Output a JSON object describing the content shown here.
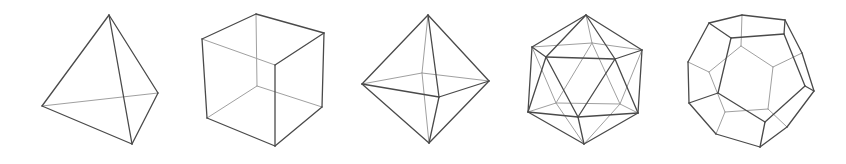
{
  "figure": {
    "colors": {
      "front_edge": "#4a4a4a",
      "back_edge": "#a0a0a0",
      "background": "#ffffff"
    },
    "solids": [
      {
        "name": "tetrahedron",
        "vertices": {
          "top": [
            109,
            15
          ],
          "left": [
            42,
            106
          ],
          "right": [
            158,
            93
          ],
          "bottom": [
            132,
            144
          ]
        },
        "front_edges": [
          [
            "top",
            "left"
          ],
          [
            "top",
            "right"
          ],
          [
            "top",
            "bottom"
          ],
          [
            "left",
            "bottom"
          ],
          [
            "right",
            "bottom"
          ]
        ],
        "back_edges": [
          [
            "left",
            "right"
          ]
        ]
      },
      {
        "name": "cube",
        "vertices": {
          "tb": [
            256,
            14
          ],
          "tl": [
            202,
            39
          ],
          "tr": [
            324,
            33
          ],
          "tf": [
            275,
            65
          ],
          "bb": [
            257,
            86
          ],
          "bl": [
            207,
            118
          ],
          "br": [
            322,
            107
          ],
          "bf": [
            275,
            146
          ]
        },
        "front_edges": [
          [
            "tb",
            "tl"
          ],
          [
            "tb",
            "tr"
          ],
          [
            "tr",
            "tf"
          ],
          [
            "tf",
            "bf"
          ],
          [
            "tl",
            "bl"
          ],
          [
            "tr",
            "br"
          ],
          [
            "bl",
            "bf"
          ],
          [
            "br",
            "bf"
          ]
        ],
        "back_edges": [
          [
            "tl",
            "tf"
          ],
          [
            "tb",
            "bb"
          ],
          [
            "bb",
            "bl"
          ],
          [
            "bb",
            "br"
          ]
        ]
      },
      {
        "name": "octahedron",
        "vertices": {
          "top": [
            428,
            15
          ],
          "left": [
            362,
            84
          ],
          "right": [
            489,
            81
          ],
          "front": [
            439,
            97
          ],
          "back": [
            422,
            73
          ],
          "bottom": [
            429,
            143
          ]
        },
        "front_edges": [
          [
            "top",
            "left"
          ],
          [
            "top",
            "right"
          ],
          [
            "top",
            "front"
          ],
          [
            "left",
            "front"
          ],
          [
            "right",
            "front"
          ],
          [
            "bottom",
            "left"
          ],
          [
            "bottom",
            "right"
          ],
          [
            "bottom",
            "front"
          ]
        ],
        "back_edges": [
          [
            "top",
            "back"
          ],
          [
            "left",
            "back"
          ],
          [
            "right",
            "back"
          ],
          [
            "bottom",
            "back"
          ]
        ]
      },
      {
        "name": "icosahedron",
        "vertices": {
          "t": [
            586,
            15
          ],
          "ul": [
            532,
            47
          ],
          "ur": [
            642,
            50
          ],
          "ufl": [
            546,
            57
          ],
          "ufr": [
            615,
            59
          ],
          "ub": [
            592,
            43
          ],
          "ll": [
            528,
            112
          ],
          "lr": [
            638,
            113
          ],
          "lf": [
            578,
            117
          ],
          "lbl": [
            556,
            103
          ],
          "lbr": [
            620,
            104
          ],
          "b": [
            584,
            144
          ]
        },
        "front_edges": [
          [
            "t",
            "ul"
          ],
          [
            "t",
            "ufl"
          ],
          [
            "t",
            "ufr"
          ],
          [
            "t",
            "ur"
          ],
          [
            "ul",
            "ufl"
          ],
          [
            "ufl",
            "ufr"
          ],
          [
            "ufr",
            "ur"
          ],
          [
            "b",
            "ll"
          ],
          [
            "b",
            "lf"
          ],
          [
            "b",
            "lr"
          ],
          [
            "ll",
            "lf"
          ],
          [
            "lf",
            "lr"
          ],
          [
            "ul",
            "ll"
          ],
          [
            "ufl",
            "ll"
          ],
          [
            "ufl",
            "lf"
          ],
          [
            "ufr",
            "lf"
          ],
          [
            "ufr",
            "lr"
          ],
          [
            "ur",
            "lr"
          ]
        ],
        "back_edges": [
          [
            "t",
            "ub"
          ],
          [
            "ub",
            "ul"
          ],
          [
            "ub",
            "ur"
          ],
          [
            "b",
            "lbl"
          ],
          [
            "b",
            "lbr"
          ],
          [
            "lbl",
            "lbr"
          ],
          [
            "ll",
            "lbl"
          ],
          [
            "lr",
            "lbr"
          ],
          [
            "ur",
            "lbr"
          ],
          [
            "ub",
            "lbr"
          ],
          [
            "ub",
            "lbl"
          ],
          [
            "ul",
            "lbl"
          ]
        ]
      },
      {
        "name": "dodecahedron",
        "vertices": {
          "A": [
            742,
            15
          ],
          "B": [
            785,
            20
          ],
          "C": [
            709,
            23
          ],
          "D": [
            731,
            38
          ],
          "E": [
            784,
            34
          ],
          "F": [
            741,
            46
          ],
          "G": [
            688,
            62
          ],
          "H": [
            709,
            72
          ],
          "I": [
            773,
            67
          ],
          "J": [
            802,
            53
          ],
          "K": [
            814,
            91
          ],
          "L": [
            805,
            86
          ],
          "M": [
            718,
            93
          ],
          "N": [
            689,
            103
          ],
          "O": [
            725,
            112
          ],
          "P": [
            768,
            109
          ],
          "Q": [
            765,
            122
          ],
          "R": [
            787,
            127
          ],
          "S": [
            716,
            134
          ],
          "T": [
            760,
            147
          ]
        },
        "front_edges": [
          [
            "C",
            "A"
          ],
          [
            "A",
            "B"
          ],
          [
            "B",
            "J"
          ],
          [
            "J",
            "K"
          ],
          [
            "K",
            "R"
          ],
          [
            "R",
            "T"
          ],
          [
            "T",
            "S"
          ],
          [
            "S",
            "N"
          ],
          [
            "N",
            "G"
          ],
          [
            "G",
            "C"
          ],
          [
            "D",
            "E"
          ],
          [
            "E",
            "L"
          ],
          [
            "L",
            "Q"
          ],
          [
            "Q",
            "M"
          ],
          [
            "M",
            "D"
          ],
          [
            "C",
            "D"
          ],
          [
            "B",
            "E"
          ],
          [
            "K",
            "L"
          ],
          [
            "T",
            "Q"
          ],
          [
            "N",
            "M"
          ]
        ],
        "back_edges": [
          [
            "A",
            "F"
          ],
          [
            "G",
            "H"
          ],
          [
            "J",
            "I"
          ],
          [
            "R",
            "P"
          ],
          [
            "S",
            "O"
          ],
          [
            "F",
            "H"
          ],
          [
            "F",
            "I"
          ],
          [
            "I",
            "P"
          ],
          [
            "P",
            "O"
          ],
          [
            "O",
            "H"
          ]
        ]
      }
    ]
  }
}
